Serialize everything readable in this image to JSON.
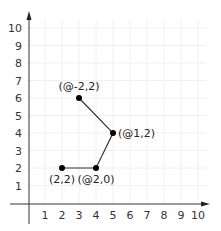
{
  "chart_data": {
    "type": "line",
    "title": "",
    "xlabel": "",
    "ylabel": "",
    "xlim": [
      0,
      10
    ],
    "ylim": [
      0,
      10
    ],
    "grid": true,
    "x_ticks": [
      "1",
      "2",
      "3",
      "4",
      "5",
      "6",
      "7",
      "8",
      "9",
      "10"
    ],
    "y_ticks": [
      "1",
      "2",
      "3",
      "4",
      "5",
      "6",
      "7",
      "8",
      "9",
      "10"
    ],
    "points": [
      {
        "x": 2,
        "y": 2,
        "label": "(2,2)",
        "label_pos": "below"
      },
      {
        "x": 4,
        "y": 2,
        "label": "(@2,0)",
        "label_pos": "below"
      },
      {
        "x": 5,
        "y": 4,
        "label": "(@1,2)",
        "label_pos": "right"
      },
      {
        "x": 3,
        "y": 6,
        "label": "(@-2,2)",
        "label_pos": "above"
      }
    ],
    "colors": {
      "line": "#333333",
      "point": "#000000",
      "axis": "#333333",
      "grid": "#f0f0f0"
    }
  }
}
